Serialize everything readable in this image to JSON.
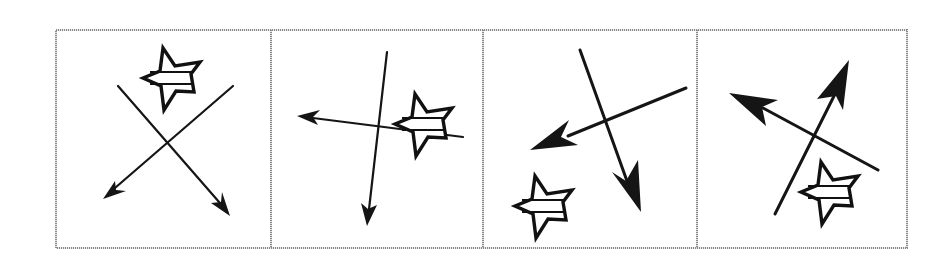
{
  "figure": {
    "panel_count": 4,
    "colors": {
      "frame": "#8a8a8a",
      "stroke": "#151515",
      "background": "#ffffff"
    },
    "panels": [
      {
        "index": 1,
        "star_icon": "star-with-band-icon",
        "star_position": "top-center",
        "arrows": [
          {
            "direction": "down-left",
            "head": "thin"
          },
          {
            "direction": "down-right",
            "head": "thin"
          }
        ]
      },
      {
        "index": 2,
        "star_icon": "star-with-band-icon",
        "star_position": "right-center",
        "arrows": [
          {
            "direction": "left",
            "head": "thin"
          },
          {
            "direction": "down",
            "head": "thin"
          }
        ]
      },
      {
        "index": 3,
        "star_icon": "star-with-band-icon",
        "star_position": "bottom-left",
        "arrows": [
          {
            "direction": "down-left",
            "head": "bold"
          },
          {
            "direction": "down",
            "head": "bold"
          }
        ]
      },
      {
        "index": 4,
        "star_icon": "star-with-band-icon",
        "star_position": "bottom-center",
        "arrows": [
          {
            "direction": "up-left",
            "head": "bold"
          },
          {
            "direction": "up-right",
            "head": "bold"
          }
        ]
      }
    ]
  }
}
